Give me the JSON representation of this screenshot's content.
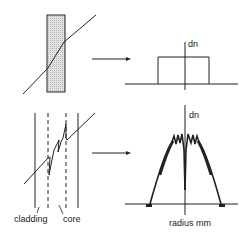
{
  "diagram": {
    "type": "refractive-index-profile-schematic",
    "colors": {
      "ink": "#222222",
      "fill": "#d8d8d8",
      "background": "#ffffff"
    },
    "top_panel": {
      "left": {
        "description": "shaded rectangular element with diagonal ray passing through and offset inside",
        "shape": "shaded-rectangle"
      },
      "arrow": "right-arrow",
      "right": {
        "axis_label": "dn",
        "profile": "step (rectangular) index profile"
      }
    },
    "bottom_panel": {
      "left": {
        "labels": {
          "cladding": "cladding",
          "core": "core"
        },
        "description": "solid cladding boundaries, dashed core boundaries, ray with zigzag inside core"
      },
      "arrow": "right-arrow",
      "right": {
        "axis_label": "dn",
        "x_axis_label": "radius mm",
        "profile": "graded (parabolic) index profile with central dip and oscillations"
      }
    }
  }
}
